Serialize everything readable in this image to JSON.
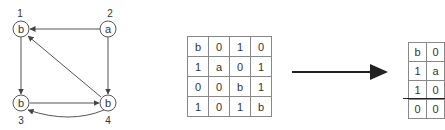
{
  "graph": {
    "nodes": [
      {
        "id": "1",
        "label": "b",
        "number": "1"
      },
      {
        "id": "2",
        "label": "a",
        "number": "2"
      },
      {
        "id": "3",
        "label": "b",
        "number": "3"
      },
      {
        "id": "4",
        "label": "b",
        "number": "4"
      }
    ],
    "edges": [
      {
        "from": "2",
        "to": "1"
      },
      {
        "from": "1",
        "to": "3"
      },
      {
        "from": "2",
        "to": "4"
      },
      {
        "from": "3",
        "to": "4"
      },
      {
        "from": "4",
        "to": "1"
      },
      {
        "from": "4",
        "to": "3",
        "curved": true
      }
    ]
  },
  "matrix_left": {
    "rows": [
      [
        "b",
        "0",
        "1",
        "0"
      ],
      [
        "1",
        "a",
        "0",
        "1"
      ],
      [
        "0",
        "0",
        "b",
        "1"
      ],
      [
        "1",
        "0",
        "1",
        "b"
      ]
    ]
  },
  "matrix_right": {
    "rows": [
      [
        "b",
        "0"
      ],
      [
        "1",
        "a"
      ],
      [
        "1",
        "0"
      ],
      [
        "0",
        "0"
      ]
    ]
  },
  "colors": {
    "stroke": "#444444",
    "arrow": "#222222",
    "grid": "#888888"
  }
}
